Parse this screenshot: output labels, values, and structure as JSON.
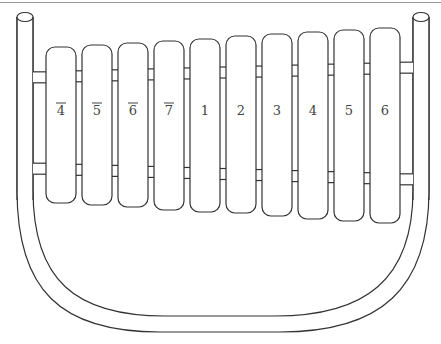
{
  "diagram": {
    "type": "xylophone",
    "posts": [
      {
        "side": "left",
        "x": 17,
        "width": 16,
        "top": 17
      },
      {
        "side": "right",
        "x": 413,
        "width": 16,
        "top": 17
      }
    ],
    "bars": [
      {
        "label": "4",
        "low_octave": true,
        "x": 46,
        "top": 47,
        "bottom": 203
      },
      {
        "label": "5",
        "low_octave": true,
        "x": 82,
        "top": 45,
        "bottom": 205
      },
      {
        "label": "6",
        "low_octave": true,
        "x": 118,
        "top": 43,
        "bottom": 207
      },
      {
        "label": "7",
        "low_octave": true,
        "x": 154,
        "top": 41,
        "bottom": 210
      },
      {
        "label": "1",
        "low_octave": false,
        "x": 190,
        "top": 39,
        "bottom": 212
      },
      {
        "label": "2",
        "low_octave": false,
        "x": 226,
        "top": 36,
        "bottom": 213
      },
      {
        "label": "3",
        "low_octave": false,
        "x": 262,
        "top": 34,
        "bottom": 216
      },
      {
        "label": "4",
        "low_octave": false,
        "x": 298,
        "top": 32,
        "bottom": 219
      },
      {
        "label": "5",
        "low_octave": false,
        "x": 334,
        "top": 30,
        "bottom": 221
      },
      {
        "label": "6",
        "low_octave": false,
        "x": 370,
        "top": 28,
        "bottom": 223
      }
    ],
    "bar_width": 30,
    "label_y": 115,
    "colors": {
      "stroke": "#333333",
      "fill": "#ffffff",
      "label": "#444444"
    }
  }
}
